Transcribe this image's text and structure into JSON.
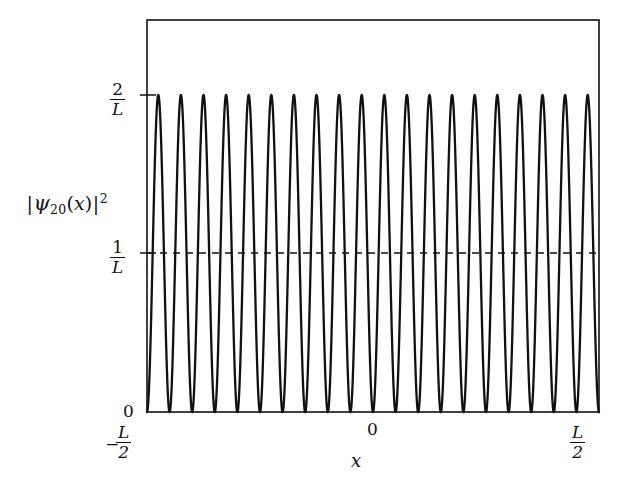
{
  "figure": {
    "kind": "physics-plot",
    "background_color": "#ffffff",
    "line_color": "#111111"
  },
  "axis_labels": {
    "y_title_parts": {
      "bar_open": "|",
      "psi": "ψ",
      "subscript": "20",
      "paren_open": "(",
      "variable": "x",
      "paren_close": ")",
      "bar_close": "|",
      "exponent": "2"
    },
    "y_title_plain": "|ψ₂₀(x)|²",
    "x_title": "x"
  },
  "y_ticks": [
    {
      "id": "two-over-L",
      "numerator": "2",
      "denominator": "L",
      "value": 2
    },
    {
      "id": "one-over-L",
      "numerator": "1",
      "denominator": "L",
      "value": 1
    },
    {
      "id": "zero",
      "label": "0",
      "value": 0
    }
  ],
  "x_ticks": [
    {
      "id": "neg-half-L",
      "sign": "−",
      "numerator": "L",
      "denominator": "2",
      "value": -0.5
    },
    {
      "id": "zero",
      "label": "0",
      "value": 0
    },
    {
      "id": "half-L",
      "numerator": "L",
      "denominator": "2",
      "value": 0.5
    }
  ],
  "chart_data": {
    "type": "line",
    "title": "",
    "xlabel": "x",
    "ylabel": "|ψ₂₀(x)|²",
    "quantum_number_n": 20,
    "peak_count": 20,
    "function": "|psi_n(x)|^2 = (2/L) * sin^2( n*pi*(x + L/2) / L )",
    "xlim": [
      -0.5,
      0.5
    ],
    "ylim": [
      0,
      2.35
    ],
    "x_tick_values": [
      -0.5,
      0,
      0.5
    ],
    "x_tick_labels": [
      "-L/2",
      "0",
      "L/2"
    ],
    "y_tick_values": [
      0,
      1,
      2
    ],
    "y_tick_labels": [
      "0",
      "1/L",
      "2/L"
    ],
    "grid": false,
    "legend": false,
    "series": [
      {
        "name": "|psi_20(x)|^2",
        "style": "solid",
        "color": "#111111",
        "amplitude_max": 2,
        "amplitude_min": 0,
        "oscillations": 20,
        "peak_x_values": [
          -0.475,
          -0.425,
          -0.375,
          -0.325,
          -0.275,
          -0.225,
          -0.175,
          -0.125,
          -0.075,
          -0.025,
          0.025,
          0.075,
          0.125,
          0.175,
          0.225,
          0.275,
          0.325,
          0.375,
          0.425,
          0.475
        ],
        "peak_y_values": [
          2,
          2,
          2,
          2,
          2,
          2,
          2,
          2,
          2,
          2,
          2,
          2,
          2,
          2,
          2,
          2,
          2,
          2,
          2,
          2
        ],
        "node_x_values": [
          -0.5,
          -0.45,
          -0.4,
          -0.35,
          -0.3,
          -0.25,
          -0.2,
          -0.15,
          -0.1,
          -0.05,
          0,
          0.05,
          0.1,
          0.15,
          0.2,
          0.25,
          0.3,
          0.35,
          0.4,
          0.45,
          0.5
        ],
        "node_y_values": [
          0,
          0,
          0,
          0,
          0,
          0,
          0,
          0,
          0,
          0,
          0,
          0,
          0,
          0,
          0,
          0,
          0,
          0,
          0,
          0,
          0
        ]
      },
      {
        "name": "classical average 1/L",
        "style": "dashed",
        "color": "#111111",
        "constant_value": 1
      }
    ]
  }
}
